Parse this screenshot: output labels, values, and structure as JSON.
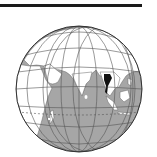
{
  "map": {
    "type": "orthographic locator globe",
    "highlighted_country": "Thailand",
    "visible_regions": [
      "Europe",
      "Africa",
      "Middle East",
      "Asia",
      "India",
      "Indian Ocean",
      "Southeast Asia",
      "Indonesia"
    ],
    "colors": {
      "ocean": "#a6a6a6",
      "land": "#ffffff",
      "highlight": "#111111",
      "graticule": "#555555",
      "borders": "#666666",
      "top_rule": "#1a1a1a"
    }
  }
}
